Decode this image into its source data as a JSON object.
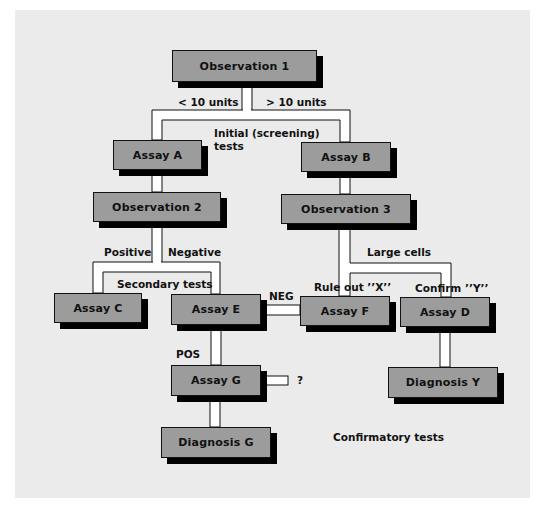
{
  "diagram": {
    "colors": {
      "background": "#ebebeb",
      "box_fill": "#9c9c9c",
      "box_border": "#111111",
      "shadow": "#000000",
      "connector": "#ffffff"
    },
    "nodes": {
      "observation1": "Observation 1",
      "assayA": "Assay A",
      "assayB": "Assay B",
      "observation2": "Observation 2",
      "observation3": "Observation 3",
      "assayC": "Assay C",
      "assayE": "Assay E",
      "assayF": "Assay F",
      "assayD": "Assay D",
      "assayG": "Assay G",
      "diagnosisG": "Diagnosis G",
      "diagnosisY": "Diagnosis Y"
    },
    "labels": {
      "lt10": "< 10 units",
      "gt10": "> 10 units",
      "initial1": "Initial (screening)",
      "initial2": "tests",
      "positive": "Positive",
      "negative": "Negative",
      "secondary": "Secondary tests",
      "largeCells": "Large cells",
      "ruleOut": "Rule out ’’X’’",
      "confirm": "Confirm ’’Y’’",
      "neg": "NEG",
      "pos": "POS",
      "question": "?",
      "confirmatory": "Confirmatory tests"
    },
    "edges": [
      {
        "from": "Observation 1",
        "to": "Assay A",
        "label": "< 10 units"
      },
      {
        "from": "Observation 1",
        "to": "Assay B",
        "label": "> 10 units"
      },
      {
        "from": "Assay A",
        "to": "Observation 2"
      },
      {
        "from": "Assay B",
        "to": "Observation 3"
      },
      {
        "from": "Observation 2",
        "to": "Assay C",
        "label": "Positive"
      },
      {
        "from": "Observation 2",
        "to": "Assay E",
        "label": "Negative"
      },
      {
        "from": "Observation 3",
        "to": "Assay F",
        "label": "Rule out \"X\""
      },
      {
        "from": "Observation 3",
        "to": "Assay D",
        "label": "Large cells / Confirm \"Y\""
      },
      {
        "from": "Assay E",
        "to": "Assay F",
        "label": "NEG"
      },
      {
        "from": "Assay E",
        "to": "Assay G",
        "label": "POS"
      },
      {
        "from": "Assay G",
        "to": "?",
        "label": "?"
      },
      {
        "from": "Assay G",
        "to": "Diagnosis G"
      },
      {
        "from": "Assay D",
        "to": "Diagnosis Y"
      }
    ]
  }
}
